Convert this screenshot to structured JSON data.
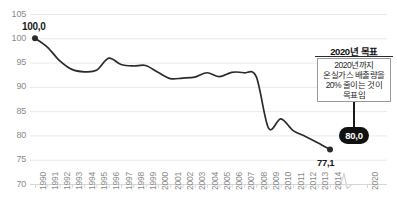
{
  "chart_data": {
    "type": "line",
    "title": "",
    "subtitle": "",
    "xlabel": "",
    "ylabel": "",
    "ylim": [
      70,
      105
    ],
    "yticks": [
      70,
      75,
      80,
      85,
      90,
      95,
      100,
      105
    ],
    "grid": true,
    "legend_position": "none",
    "axis_break": {
      "between": [
        "2014",
        "2020"
      ],
      "symbol": "zigzag"
    },
    "categories": [
      "1990",
      "1991",
      "1992",
      "1993",
      "1994",
      "1995",
      "1996",
      "1997",
      "1998",
      "1999",
      "2000",
      "2001",
      "2002",
      "2003",
      "2004",
      "2005",
      "2006",
      "2007",
      "2008",
      "2009",
      "2010",
      "2011",
      "2012",
      "2013",
      "2014",
      "2020"
    ],
    "series": [
      {
        "name": "온실가스 배출량 지수",
        "values": [
          100.0,
          98.2,
          95.4,
          93.6,
          93.1,
          93.4,
          95.9,
          94.6,
          94.3,
          94.4,
          93.0,
          91.7,
          91.8,
          92.0,
          92.9,
          92.1,
          93.0,
          92.9,
          92.1,
          81.5,
          83.4,
          81.0,
          79.8,
          78.5,
          77.1,
          null
        ]
      }
    ],
    "point_labels": [
      {
        "category": "1990",
        "value": 100.0,
        "text": "100,0",
        "position": "above"
      },
      {
        "category": "2014",
        "value": 77.1,
        "text": "77,1",
        "position": "below"
      }
    ],
    "target_marker": {
      "category": "2020",
      "value": 80.0,
      "text": "80,0"
    }
  },
  "annotation": {
    "title": "2020년 목표",
    "lines": [
      "2020년까지",
      "온실가스 배출량을",
      "20% 줄이는 것이",
      "목표임"
    ]
  },
  "colors": {
    "line": "#2b2b2b",
    "grid": "#e9e9e9",
    "axis": "#d6d6d6",
    "tick_text": "#8a8a8a",
    "value_text": "#1a1a1a",
    "pill_bg": "#111111",
    "pill_text": "#ffffff",
    "box_border": "#9a9a9a",
    "background": "#ffffff"
  }
}
